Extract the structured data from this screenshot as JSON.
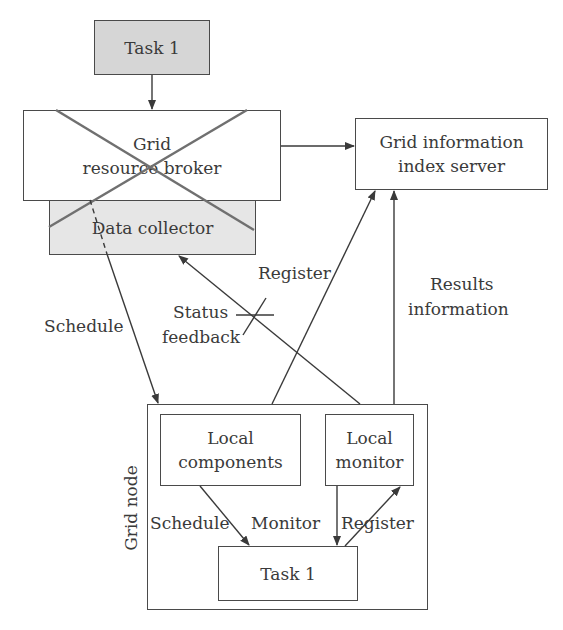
{
  "diagram": {
    "nodes": {
      "task_top": {
        "label": "Task 1",
        "fill": "#d6d6d6"
      },
      "broker": {
        "line1": "Grid",
        "line2": "resource broker",
        "fill": "#ffffff",
        "status": "crossed-out"
      },
      "collector": {
        "label": "Data collector",
        "fill": "#e6e6e6"
      },
      "index_server": {
        "line1": "Grid information",
        "line2": "index server",
        "fill": "#ffffff"
      },
      "grid_node": {
        "label": "Grid node"
      },
      "local_components": {
        "line1": "Local",
        "line2": "components"
      },
      "local_monitor": {
        "line1": "Local",
        "line2": "monitor"
      },
      "task_bottom": {
        "label": "Task 1"
      }
    },
    "edges": [
      {
        "from": "task_top",
        "to": "broker",
        "label": ""
      },
      {
        "from": "broker",
        "to": "index_server",
        "label": ""
      },
      {
        "from": "collector",
        "to": "grid_node",
        "label": "Schedule"
      },
      {
        "from": "grid_node",
        "to": "collector",
        "label": "Status feedback",
        "status": "crossed-out"
      },
      {
        "from": "grid_node",
        "to": "index_server",
        "label": "Register"
      },
      {
        "from": "grid_node",
        "to": "index_server",
        "label": "Results information"
      },
      {
        "from": "local_components",
        "to": "task_bottom",
        "label": "Schedule"
      },
      {
        "from": "local_monitor",
        "to": "task_bottom",
        "label": "Monitor"
      },
      {
        "from": "task_bottom",
        "to": "local_monitor",
        "label": "Register"
      }
    ],
    "labels": {
      "schedule_outer": "Schedule",
      "status_line1": "Status",
      "status_line2": "feedback",
      "register_outer": "Register",
      "results_line1": "Results",
      "results_line2": "information",
      "schedule_inner": "Schedule",
      "monitor_inner": "Monitor",
      "register_inner": "Register"
    },
    "colors": {
      "stroke": "#4a4a4a",
      "cross": "#707070"
    }
  }
}
